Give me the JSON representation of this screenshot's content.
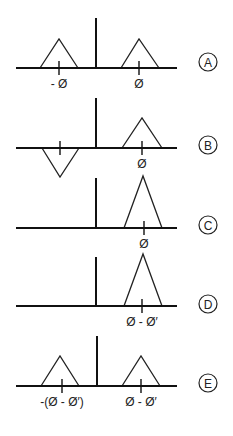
{
  "figure": {
    "panels": [
      {
        "id": "A",
        "axis": {
          "x1": 16,
          "x2": 177,
          "y": 68
        },
        "center_bar": {
          "x": 96,
          "top": 18
        },
        "triangles": [
          {
            "apex_x": 59,
            "apex_y": 39,
            "base_left": 40,
            "base_right": 78,
            "inverted": false,
            "tick_x": 59,
            "label": "- Ø"
          },
          {
            "apex_x": 139,
            "apex_y": 39,
            "base_left": 121,
            "base_right": 159,
            "inverted": false,
            "tick_x": 139,
            "label": "Ø"
          }
        ],
        "badge": {
          "letter": "A",
          "cx": 208,
          "cy": 62
        }
      },
      {
        "id": "B",
        "axis": {
          "x1": 16,
          "x2": 177,
          "y": 148
        },
        "center_bar": {
          "x": 96,
          "top": 98
        },
        "triangles": [
          {
            "apex_x": 60,
            "apex_y": 177,
            "base_left": 42,
            "base_right": 79,
            "inverted": true,
            "tick_x": 60,
            "label": ""
          },
          {
            "apex_x": 142,
            "apex_y": 118,
            "base_left": 122,
            "base_right": 162,
            "inverted": false,
            "tick_x": 142,
            "label": "Ø"
          }
        ],
        "badge": {
          "letter": "B",
          "cx": 208,
          "cy": 145
        }
      },
      {
        "id": "C",
        "axis": {
          "x1": 16,
          "x2": 177,
          "y": 228
        },
        "center_bar": {
          "x": 96,
          "top": 178
        },
        "triangles": [
          {
            "apex_x": 143,
            "apex_y": 176,
            "base_left": 124,
            "base_right": 162,
            "inverted": false,
            "tick_x": 144,
            "label": "Ø"
          }
        ],
        "badge": {
          "letter": "C",
          "cx": 208,
          "cy": 225
        }
      },
      {
        "id": "D",
        "axis": {
          "x1": 16,
          "x2": 177,
          "y": 306
        },
        "center_bar": {
          "x": 96,
          "top": 257
        },
        "triangles": [
          {
            "apex_x": 143,
            "apex_y": 254,
            "base_left": 124,
            "base_right": 162,
            "inverted": false,
            "tick_x": 142,
            "label": "Ø - Ø′"
          }
        ],
        "badge": {
          "letter": "D",
          "cx": 208,
          "cy": 304
        }
      },
      {
        "id": "E",
        "axis": {
          "x1": 16,
          "x2": 177,
          "y": 386
        },
        "center_bar": {
          "x": 97,
          "top": 336
        },
        "triangles": [
          {
            "apex_x": 60,
            "apex_y": 356,
            "base_left": 41,
            "base_right": 79,
            "inverted": false,
            "tick_x": 62,
            "label": "-(Ø - Ø′)"
          },
          {
            "apex_x": 141,
            "apex_y": 356,
            "base_left": 122,
            "base_right": 160,
            "inverted": false,
            "tick_x": 141,
            "label": "Ø - Ø′"
          }
        ],
        "badge": {
          "letter": "E",
          "cx": 208,
          "cy": 383
        }
      }
    ],
    "colors": {
      "line": "#111111",
      "background": "#ffffff"
    }
  }
}
